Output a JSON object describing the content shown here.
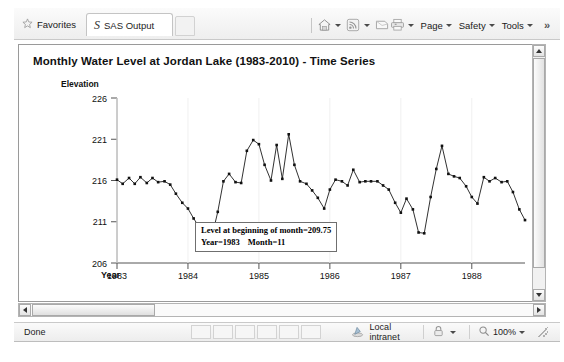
{
  "browser": {
    "favorites_label": "Favorites",
    "favorites_icon": "star-icon",
    "tab_label": "SAS Output",
    "tab_logo": "sas-logo-icon",
    "commands": [
      {
        "icon": "home-icon",
        "label": ""
      },
      {
        "icon": "rss-feed-icon",
        "label": ""
      },
      {
        "icon": "mail-icon",
        "label": ""
      },
      {
        "icon": "print-icon",
        "label": ""
      },
      {
        "icon": "",
        "label": "Page"
      },
      {
        "icon": "",
        "label": "Safety"
      },
      {
        "icon": "",
        "label": "Tools"
      }
    ],
    "overflow_label": "»"
  },
  "chart_data": {
    "type": "line",
    "title": "Monthly Water Level at Jordan Lake (1983-2010) - Time Series",
    "xlabel": "Year",
    "ylabel": "Elevation",
    "xlim": [
      1983,
      1988.75
    ],
    "ylim": [
      206,
      226
    ],
    "yticks": [
      206,
      211,
      216,
      221,
      226
    ],
    "xticks": [
      1983,
      1984,
      1985,
      1986,
      1987,
      1988
    ],
    "grid": false,
    "legend": "none",
    "marker": "square",
    "x": [
      1983.0,
      1983.08,
      1983.17,
      1983.25,
      1983.33,
      1983.42,
      1983.5,
      1983.58,
      1983.67,
      1983.75,
      1983.83,
      1983.92,
      1984.0,
      1984.08,
      1984.17,
      1984.25,
      1984.33,
      1984.42,
      1984.5,
      1984.58,
      1984.67,
      1984.75,
      1984.83,
      1984.92,
      1985.0,
      1985.08,
      1985.17,
      1985.25,
      1985.33,
      1985.42,
      1985.5,
      1985.58,
      1985.67,
      1985.75,
      1985.83,
      1985.92,
      1986.0,
      1986.08,
      1986.17,
      1986.25,
      1986.33,
      1986.42,
      1986.5,
      1986.58,
      1986.67,
      1986.75,
      1986.83,
      1986.92,
      1987.0,
      1987.08,
      1987.17,
      1987.25,
      1987.33,
      1987.42,
      1987.5,
      1987.58,
      1987.67,
      1987.75,
      1987.83,
      1987.92,
      1988.0,
      1988.08,
      1988.17,
      1988.25,
      1988.33,
      1988.42,
      1988.5,
      1988.58,
      1988.67,
      1988.75
    ],
    "values": [
      216.1,
      215.6,
      216.3,
      215.6,
      216.4,
      215.7,
      216.3,
      215.8,
      215.9,
      215.5,
      214.4,
      213.3,
      212.6,
      211.4,
      210.2,
      209.75,
      208.9,
      212.2,
      215.9,
      216.8,
      215.8,
      215.7,
      219.6,
      220.9,
      220.4,
      217.9,
      216.0,
      220.3,
      216.2,
      221.6,
      217.9,
      215.9,
      215.6,
      214.8,
      213.9,
      212.6,
      214.9,
      216.1,
      215.9,
      215.4,
      217.3,
      215.8,
      215.9,
      215.9,
      215.9,
      215.4,
      214.9,
      213.3,
      212.1,
      213.8,
      212.5,
      209.7,
      209.6,
      214.0,
      217.4,
      220.2,
      216.8,
      216.5,
      216.3,
      215.3,
      214.0,
      213.2,
      216.4,
      215.9,
      216.3,
      215.8,
      215.9,
      214.6,
      212.5,
      211.2
    ]
  },
  "tooltip": {
    "line1": "Level at beginning of month=209.75",
    "line2_year": "Year=1983",
    "line2_month": "Month=11"
  },
  "status": {
    "done": "Done",
    "zone_icon": "internet-zone-icon",
    "zone": "Local intranet",
    "protected_icon": "lock-icon",
    "zoom": "100%"
  }
}
